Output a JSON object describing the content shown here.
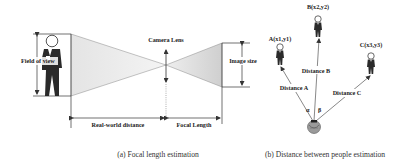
{
  "panel_a": {
    "caption": "(a) Focal length estimation",
    "labels": {
      "field_of_view": "Field of view",
      "camera_lens": "Camera Lens",
      "image_size": "Image size",
      "real_world_distance": "Real-world distance",
      "focal_length": "Focal Length"
    }
  },
  "panel_b": {
    "caption": "(b) Distance between people estimation",
    "people": [
      {
        "id": "A",
        "label": "A(x1,y1)"
      },
      {
        "id": "B",
        "label": "B(x2,y2)"
      },
      {
        "id": "C",
        "label": "C(x3,y3)"
      }
    ],
    "distances": {
      "a": "Distance A",
      "b": "Distance B",
      "c": "Distance C"
    },
    "angles": {
      "alpha": "α",
      "beta": "β"
    }
  },
  "colors": {
    "cone_fill": "#d8d8d8",
    "line": "#333333",
    "person": "#2a2a2a"
  }
}
